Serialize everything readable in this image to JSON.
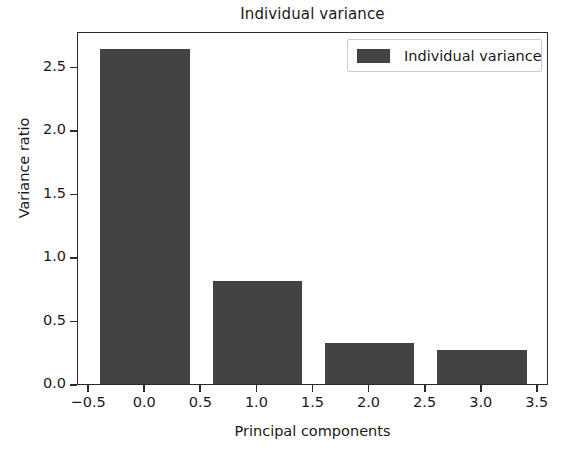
{
  "chart_data": {
    "type": "bar",
    "title": "Individual variance",
    "xlabel": "Principal components",
    "ylabel": "Variance ratio",
    "categories": [
      0,
      1,
      2,
      3
    ],
    "values": [
      2.64,
      0.81,
      0.32,
      0.27
    ],
    "series": [
      {
        "name": "Individual variance",
        "values": [
          2.64,
          0.81,
          0.32,
          0.27
        ],
        "color": "#434343"
      }
    ],
    "bar_width": 0.8,
    "xlim": [
      -0.6,
      3.6
    ],
    "ylim": [
      0.0,
      2.78
    ],
    "xticks": [
      -0.5,
      0.0,
      0.5,
      1.0,
      1.5,
      2.0,
      2.5,
      3.0,
      3.5
    ],
    "xticklabels": [
      "−0.5",
      "0.0",
      "0.5",
      "1.0",
      "1.5",
      "2.0",
      "2.5",
      "3.0",
      "3.5"
    ],
    "yticks": [
      0.0,
      0.5,
      1.0,
      1.5,
      2.0,
      2.5
    ],
    "yticklabels": [
      "0.0",
      "0.5",
      "1.0",
      "1.5",
      "2.0",
      "2.5"
    ],
    "grid": false,
    "legend": {
      "position": "upper right",
      "entries": [
        {
          "label": "Individual variance",
          "color": "#434343"
        }
      ]
    }
  },
  "legend": {
    "label": "Individual variance"
  },
  "colors": {
    "bar": "#434343",
    "axis": "#2b2b2b",
    "text": "#1a1a1a",
    "background": "#ffffff"
  }
}
